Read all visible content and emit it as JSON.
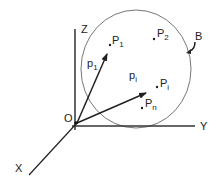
{
  "diagram": {
    "axes": {
      "z_label": "Z",
      "y_label": "Y",
      "x_label": "X",
      "origin_label": "O"
    },
    "region": {
      "label": "B",
      "shape": "circle"
    },
    "points": [
      {
        "name": "P",
        "sub": "1"
      },
      {
        "name": "P",
        "sub": "2"
      },
      {
        "name": "P",
        "sub": "i"
      },
      {
        "name": "P",
        "sub": "n"
      }
    ],
    "vectors": [
      {
        "name": "p",
        "sub": "1"
      },
      {
        "name": "p",
        "sub": "i"
      }
    ],
    "colors": {
      "axis": "#333333",
      "circle": "#777777",
      "text": "#222222"
    }
  }
}
